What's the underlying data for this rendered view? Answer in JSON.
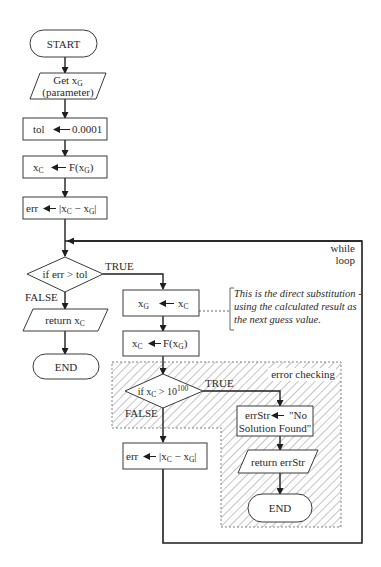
{
  "diagram": {
    "type": "flowchart",
    "nodes": {
      "start": {
        "shape": "terminal",
        "label": "START"
      },
      "get_xg": {
        "shape": "parallelogram",
        "line1": "Get x",
        "line1_sub": "G",
        "line2": "(parameter)"
      },
      "tol": {
        "shape": "process",
        "lhs": "tol",
        "rhs": "0.0001"
      },
      "calc_xc": {
        "shape": "process",
        "lhs": "x",
        "lhs_sub": "C",
        "rhs": "F(x",
        "rhs_sub": "G",
        "rhs_end": ")"
      },
      "calc_err": {
        "shape": "process",
        "lhs": "err",
        "rhs": "|x",
        "rhs_sub1": "C",
        "mid": " − x",
        "rhs_sub2": "G",
        "rhs_end": "|"
      },
      "decision_err": {
        "shape": "decision",
        "label": "if err > tol",
        "true_label": "TRUE",
        "false_label": "FALSE"
      },
      "return_xc": {
        "shape": "parallelogram",
        "label": "return x",
        "label_sub": "C"
      },
      "end_main": {
        "shape": "terminal",
        "label": "END"
      },
      "assign_xg": {
        "shape": "process",
        "lhs": "x",
        "lhs_sub": "G",
        "rhs": "x",
        "rhs_sub": "C"
      },
      "recalc_xc": {
        "shape": "process",
        "lhs": "x",
        "lhs_sub": "C",
        "rhs": "F(x",
        "rhs_sub": "G",
        "rhs_end": ")"
      },
      "decision_overflow": {
        "shape": "decision",
        "label": "if x",
        "label_sub": "C",
        "label_rest": " > 10",
        "label_sup": "100",
        "true_label": "TRUE",
        "false_label": "FALSE"
      },
      "err_str": {
        "shape": "process",
        "line1_lhs": "errStr",
        "line1_rhs": "\"No",
        "line2": "Solution Found\""
      },
      "return_err": {
        "shape": "parallelogram",
        "label": "return errStr"
      },
      "end_err": {
        "shape": "terminal",
        "label": "END"
      },
      "recalc_err": {
        "shape": "process",
        "lhs": "err",
        "rhs": "|x",
        "rhs_sub1": "C",
        "mid": " − x",
        "rhs_sub2": "G",
        "rhs_end": "|"
      }
    },
    "regions": {
      "while_loop": {
        "label_line1": "while",
        "label_line2": "loop"
      },
      "error_checking": {
        "label": "error checking",
        "fill": "hatched"
      }
    },
    "annotation": {
      "line1": "This is the direct substitution -",
      "line2": "using the calculated result as",
      "line3": "the next guess value."
    },
    "colors": {
      "line": "#1e1e1e",
      "text": "#2a2a2a",
      "background": "#ffffff"
    }
  }
}
